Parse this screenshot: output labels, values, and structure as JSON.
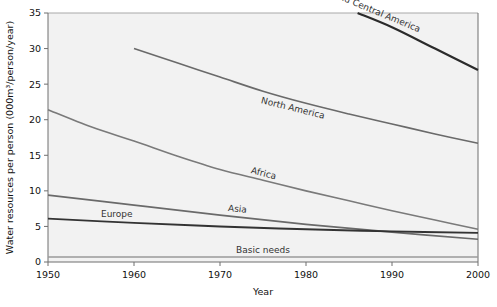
{
  "chart_data": {
    "type": "line",
    "title": "",
    "xlabel": "Year",
    "ylabel": "Water resources per person (000m³/person/year)",
    "xlim": [
      1950,
      2000
    ],
    "ylim": [
      0,
      35
    ],
    "xticks": [
      "1950",
      "1960",
      "1970",
      "1980",
      "1990",
      "2000"
    ],
    "yticks": [
      "0",
      "5",
      "10",
      "15",
      "20",
      "25",
      "30",
      "35"
    ],
    "grid": false,
    "legend": "in-plot inline labels",
    "series": [
      {
        "name": "South and Central America",
        "label": "South and Central America",
        "color": "#2b2b2b",
        "width": 2.2,
        "x": [
          1986,
          1990,
          1995,
          2000
        ],
        "values": [
          35.0,
          33.0,
          30.0,
          27.0
        ]
      },
      {
        "name": "North America",
        "label": "North America",
        "color": "#6a6a6a",
        "width": 1.6,
        "x": [
          1960,
          1965,
          1970,
          1975,
          1980,
          1985,
          1990,
          1995,
          2000
        ],
        "values": [
          30.0,
          28.0,
          26.0,
          24.0,
          22.3,
          20.8,
          19.4,
          18.0,
          16.7
        ]
      },
      {
        "name": "Africa",
        "label": "Africa",
        "color": "#7a7a7a",
        "width": 1.6,
        "x": [
          1950,
          1955,
          1960,
          1965,
          1970,
          1975,
          1980,
          1985,
          1990,
          1995,
          2000
        ],
        "values": [
          21.4,
          19.0,
          17.0,
          14.9,
          13.0,
          11.5,
          10.0,
          8.6,
          7.2,
          5.9,
          4.6
        ]
      },
      {
        "name": "Asia",
        "label": "Asia",
        "color": "#6a6a6a",
        "width": 1.7,
        "x": [
          1950,
          1960,
          1970,
          1980,
          1990,
          2000
        ],
        "values": [
          9.4,
          8.0,
          6.6,
          5.3,
          4.2,
          3.2
        ]
      },
      {
        "name": "Europe",
        "label": "Europe",
        "color": "#333333",
        "width": 1.9,
        "x": [
          1950,
          1960,
          1970,
          1980,
          1990,
          2000
        ],
        "values": [
          6.1,
          5.5,
          5.0,
          4.6,
          4.3,
          4.1
        ]
      },
      {
        "name": "Basic needs",
        "label": "Basic needs",
        "color": "#9a9a9a",
        "width": 1.6,
        "x": [
          1950,
          2000
        ],
        "values": [
          0.7,
          0.7
        ]
      }
    ]
  }
}
